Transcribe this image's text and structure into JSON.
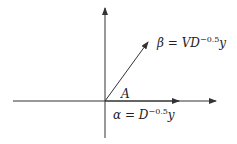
{
  "diagram": {
    "colors": {
      "stroke": "#333333",
      "text": "#222222",
      "background": "#ffffff"
    },
    "origin_label": "A",
    "beta": {
      "lhs": "β",
      "eq": " = ",
      "v": "V",
      "d": "D",
      "exp": "−0.5",
      "y": "y"
    },
    "alpha": {
      "lhs": "α",
      "eq": " = ",
      "d": "D",
      "exp": "−0.5",
      "y": "y"
    }
  }
}
